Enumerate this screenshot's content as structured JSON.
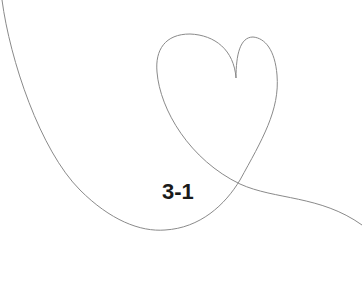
{
  "label": "3-1",
  "colors": {
    "line": "#8a8a8a",
    "text": "#1a1a1a",
    "background": "#ffffff"
  },
  "illustration": {
    "icon": "heart-line-drawing-icon"
  }
}
